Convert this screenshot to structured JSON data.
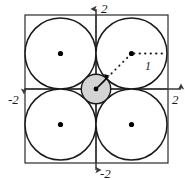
{
  "figure": {
    "colors": {
      "stroke": "#1a1a1a",
      "axis": "#3a3a3a",
      "square": "#2a2a2a",
      "circle_fill": "#ffffff",
      "center_circle_fill": "#d4d4d4",
      "dot": "#000000",
      "background": "#ffffff",
      "label": "#1a1a1a"
    },
    "axes": {
      "x_label_left": "-2",
      "x_label_right": "2",
      "y_label_top": "2",
      "y_label_bottom": "-2",
      "origin_px": [
        96,
        89
      ],
      "unit_px": 35.5,
      "x_range": [
        -2.35,
        2.35
      ],
      "y_range": [
        -2.35,
        2.35
      ]
    },
    "square": {
      "name": "bounding-square",
      "x_min": -2,
      "x_max": 2,
      "y_min": -2,
      "y_max": 2,
      "px": {
        "left": 25,
        "top": 15,
        "right": 168,
        "bottom": 163
      }
    },
    "circles": [
      {
        "name": "circle-top-left",
        "cx": -1,
        "cy": 1,
        "r": 1,
        "cx_px": 60.5,
        "cy_px": 53.5,
        "r_px": 35.5,
        "fill": "#ffffff",
        "has_center_dot": true
      },
      {
        "name": "circle-top-right",
        "cx": 1,
        "cy": 1,
        "r": 1,
        "cx_px": 131.5,
        "cy_px": 53.5,
        "r_px": 35.5,
        "fill": "#ffffff",
        "has_center_dot": true
      },
      {
        "name": "circle-bottom-left",
        "cx": -1,
        "cy": -1,
        "r": 1,
        "cx_px": 60.5,
        "cy_px": 124.5,
        "r_px": 35.5,
        "fill": "#ffffff",
        "has_center_dot": true
      },
      {
        "name": "circle-bottom-right",
        "cx": 1,
        "cy": -1,
        "r": 1,
        "cx_px": 131.5,
        "cy_px": 124.5,
        "r_px": 35.5,
        "fill": "#ffffff",
        "has_center_dot": true
      }
    ],
    "center_circle": {
      "name": "center-circle",
      "cx": 0,
      "cy": 0,
      "r": 0.414,
      "cx_px": 96,
      "cy_px": 89,
      "r_px": 14.7,
      "fill": "#d4d4d4",
      "note": "shaded small circle tangent to the four unit circles"
    },
    "radius_arrow": {
      "name": "center-radius-arrow",
      "from_px": [
        96,
        89
      ],
      "to_px": [
        106.4,
        78.6
      ],
      "style": "solid-with-arrowhead"
    },
    "dotted_diagonal": {
      "name": "dotted-diagonal-segment",
      "from_px": [
        106.4,
        78.6
      ],
      "to_px": [
        131.5,
        53.5
      ],
      "style": "dotted"
    },
    "dotted_horizontal": {
      "name": "dotted-radius-segment",
      "from_px": [
        131.5,
        53.5
      ],
      "to_px": [
        167,
        53.5
      ],
      "style": "dotted",
      "label": "1"
    },
    "labels": {
      "segment_one": "1"
    }
  }
}
